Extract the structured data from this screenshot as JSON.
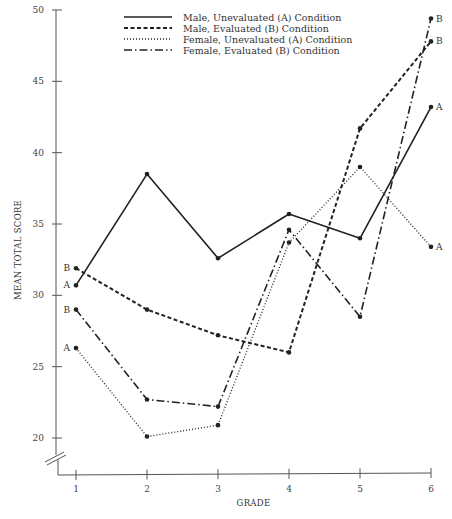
{
  "chart_data": {
    "type": "line",
    "title": "",
    "xlabel": "GRADE",
    "ylabel": "MEAN TOTAL SCORE",
    "x": [
      1,
      2,
      3,
      4,
      5,
      6
    ],
    "x_tick_labels": [
      "1",
      "2",
      "3",
      "4",
      "5",
      "6"
    ],
    "y_ticks": [
      20,
      25,
      30,
      35,
      40,
      45,
      50
    ],
    "y_tick_labels": [
      "20",
      "25",
      "30",
      "35",
      "40",
      "45",
      "50"
    ],
    "ylim": [
      20,
      50
    ],
    "y_axis_break": true,
    "grid": false,
    "legend_position": "top-center",
    "series": [
      {
        "name": "Male, Unevaluated (A) Condition",
        "style": "solid",
        "values": [
          30.7,
          38.5,
          32.6,
          35.7,
          34.0,
          43.2
        ],
        "start_label": "A",
        "end_label": "A"
      },
      {
        "name": "Male, Evaluated (B) Condition",
        "style": "dashed",
        "values": [
          31.9,
          29.0,
          27.2,
          26.0,
          41.7,
          47.8
        ],
        "start_label": "B",
        "end_label": "B"
      },
      {
        "name": "Female, Unevaluated (A) Condition",
        "style": "dotted",
        "values": [
          26.3,
          20.1,
          20.9,
          33.7,
          39.0,
          33.4
        ],
        "start_label": "A",
        "end_label": "A"
      },
      {
        "name": "Female, Evaluated (B) Condition",
        "style": "dash-dot",
        "values": [
          29.0,
          22.7,
          22.2,
          34.6,
          28.5,
          49.4
        ],
        "start_label": "B",
        "end_label": "B"
      }
    ]
  }
}
